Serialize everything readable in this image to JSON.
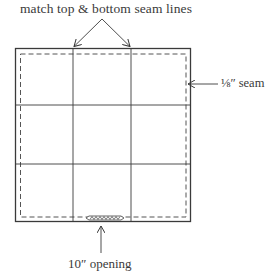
{
  "diagram": {
    "annotations": {
      "top": "match top & bottom seam lines",
      "seam": "⅛″ seam",
      "opening": "10″ opening"
    },
    "grid": {
      "rows": 3,
      "columns": 3
    },
    "colors": {
      "line": "#3a3a3a",
      "dash": "#555555",
      "background": "#ffffff"
    }
  }
}
